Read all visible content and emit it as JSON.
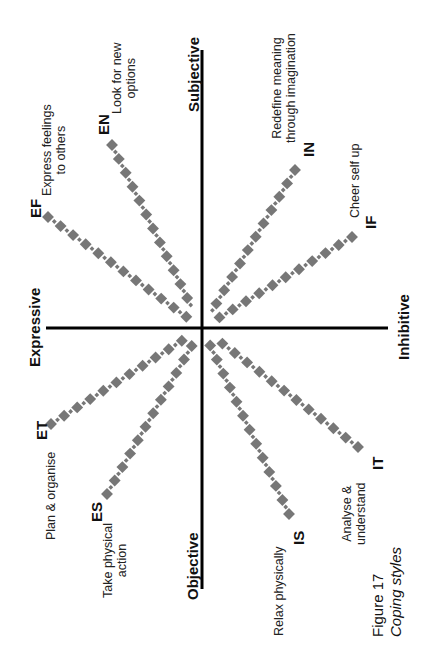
{
  "figure": {
    "number_label": "Figure 17",
    "title": "Coping styles"
  },
  "axes": {
    "top": "Subjective",
    "bottom": "Objective",
    "left": "Expressive",
    "right": "Inhibitive"
  },
  "colors": {
    "axis": "#000000",
    "dots": "#777777",
    "text": "#111111"
  },
  "styles": [
    {
      "code": "EF",
      "description_line1": "Express feelings",
      "description_line2": "to others"
    },
    {
      "code": "EN",
      "description_line1": "Look for new",
      "description_line2": "options"
    },
    {
      "code": "IN",
      "description_line1": "Redefine meaning",
      "description_line2": "through imagination"
    },
    {
      "code": "IF",
      "description_line1": "Cheer self up",
      "description_line2": ""
    },
    {
      "code": "ET",
      "description_line1": "Plan & organise",
      "description_line2": ""
    },
    {
      "code": "ES",
      "description_line1": "Take physical",
      "description_line2": "action"
    },
    {
      "code": "IS",
      "description_line1": "Relax physically",
      "description_line2": ""
    },
    {
      "code": "IT",
      "description_line1": "Analyse &",
      "description_line2": "understand"
    }
  ]
}
